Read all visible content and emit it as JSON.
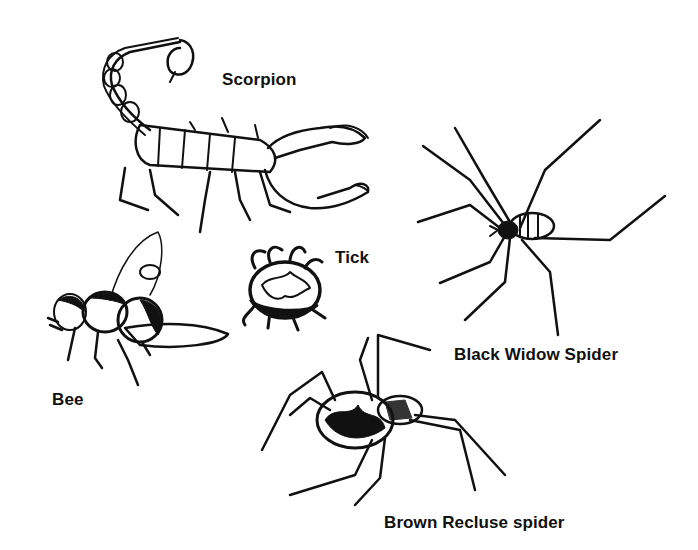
{
  "illustration": {
    "background": "#ffffff",
    "ink_color": "#111111",
    "creatures": [
      {
        "id": "scorpion",
        "label": "Scorpion"
      },
      {
        "id": "tick",
        "label": "Tick"
      },
      {
        "id": "bee",
        "label": "Bee"
      },
      {
        "id": "black-widow",
        "label": "Black Widow Spider"
      },
      {
        "id": "brown-recluse",
        "label": "Brown Recluse spider"
      }
    ]
  }
}
